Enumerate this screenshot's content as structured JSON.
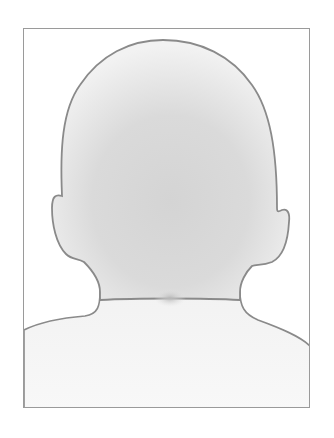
{
  "illustration": {
    "subject": "back of head and shoulders silhouette",
    "colors": {
      "background": "#ffffff",
      "frame_border": "#9a9a9a",
      "outline": "#8a8a8a",
      "head_fill_light": "#f1f1f1",
      "head_fill_dark": "#d6d6d6",
      "body_fill": "#f6f6f6",
      "neck_shadow": "#bdbdbd"
    }
  }
}
